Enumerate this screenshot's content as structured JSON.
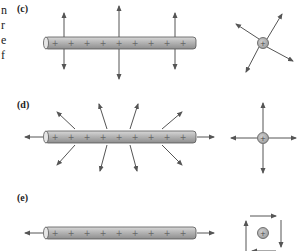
{
  "side_text": [
    "n",
    "r",
    "e",
    "f"
  ],
  "panels": [
    {
      "label": "(c)",
      "description": "Charged rod with perpendicular field arrows; point charge with diagonal field arrows"
    },
    {
      "label": "(d)",
      "description": "Charged rod with radiating field arrows including axial; point charge with four orthogonal outward arrows"
    },
    {
      "label": "(e)",
      "description": "Charged rod with axial arrows only; point charge with circulating square of arrows"
    }
  ],
  "rod_charge_symbol": "+",
  "rod_plus_count": 9,
  "colors": {
    "rod_fill": "#a9a9a9",
    "rod_edge": "#555555",
    "arrow": "#555555",
    "charge_fill": "#b0b0b0"
  }
}
